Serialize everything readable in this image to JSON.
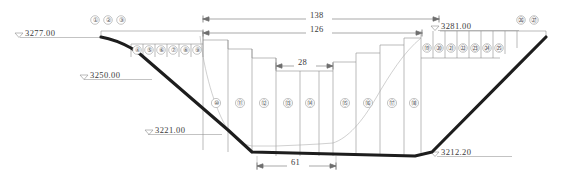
{
  "drawing": {
    "title": "Dam cross-section profile",
    "type": "engineering-cross-section"
  },
  "elevations": [
    {
      "id": "left-top",
      "label": "3277.00",
      "symbol": "triangle-down"
    },
    {
      "id": "left-mid",
      "label": "3250.00",
      "symbol": "triangle-down"
    },
    {
      "id": "left-low",
      "label": "3221.00",
      "symbol": "triangle-down"
    },
    {
      "id": "right-top",
      "label": "3281.00",
      "symbol": "triangle-down"
    },
    {
      "id": "bottom",
      "label": "3212.20",
      "symbol": "triangle-down"
    }
  ],
  "dimensions": [
    {
      "id": "overall-top",
      "label": "138"
    },
    {
      "id": "overall-second",
      "label": "126"
    },
    {
      "id": "center-step",
      "label": "28"
    },
    {
      "id": "base-width",
      "label": "61"
    }
  ],
  "segments": {
    "top_left": [
      "①",
      "②",
      "③"
    ],
    "left_slope": [
      "④",
      "⑤",
      "⑥",
      "⑦",
      "⑧",
      "⑨"
    ],
    "center": [
      "⑩",
      "⑪",
      "⑫",
      "⑬",
      "⑭",
      "⑮",
      "⑯",
      "⑰",
      "⑱"
    ],
    "right_slope": [
      "⑲",
      "⑳",
      "㉑",
      "㉒",
      "㉓",
      "㉔",
      "㉕"
    ],
    "top_right": [
      "㉖",
      "㉗"
    ]
  },
  "colors": {
    "ground_line": "#1d1d1d",
    "thin_line": "#8d8d8d",
    "text": "#3a3a3a",
    "background": "#ffffff"
  }
}
